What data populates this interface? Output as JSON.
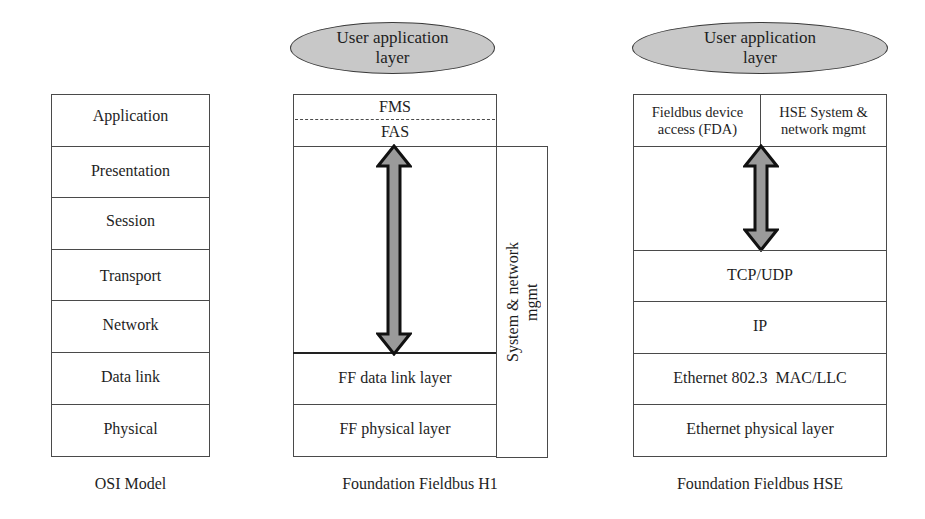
{
  "osi_model": {
    "caption": "OSI Model",
    "layers": [
      "Application",
      "Presentation",
      "Session",
      "Transport",
      "Network",
      "Data link",
      "Physical"
    ]
  },
  "ff_h1": {
    "caption": "Foundation Fieldbus H1",
    "user_layer": "User application layer",
    "fms": "FMS",
    "fas": "FAS",
    "data_link": "FF data link layer",
    "physical": "FF physical layer",
    "mgmt": "System & network mgmt"
  },
  "ff_hse": {
    "caption": "Foundation Fieldbus HSE",
    "user_layer": "User application layer",
    "fda": "Fieldbus device access (FDA)",
    "hse_mgmt": "HSE System & network mgmt",
    "transport": "TCP/UDP",
    "network": "IP",
    "data_link": "Ethernet 802.3  MAC/LLC",
    "physical": "Ethernet physical layer"
  },
  "colors": {
    "ellipse_fill": "#c8c8c8",
    "arrow_fill": "#9a9a9a",
    "line": "#4a4a4a"
  }
}
